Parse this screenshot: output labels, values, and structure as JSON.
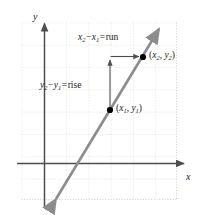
{
  "figure": {
    "background_color": "#ffffff",
    "width": 201,
    "height": 215
  },
  "axes": {
    "x_label": "x",
    "y_label": "y",
    "axis_color": "#4d4d4d",
    "grid_color": "#c8c8c8",
    "grid_spacing": 22,
    "origin": {
      "x": 44,
      "y": 163
    }
  },
  "line": {
    "color": "#8c8c8c",
    "from": {
      "x": 53,
      "y": 203
    },
    "to": {
      "x": 162,
      "y": 25
    },
    "double_arrow": true
  },
  "points": [
    {
      "name": "point-1",
      "label_x": "x",
      "label_x_sub": "1",
      "label_y": "y",
      "label_y_sub": "1",
      "x": 110,
      "y": 110,
      "color": "#000000"
    },
    {
      "name": "point-2",
      "label_x": "x",
      "label_x_sub": "2",
      "label_y": "y",
      "label_y_sub": "2",
      "x": 143,
      "y": 57,
      "color": "#000000"
    }
  ],
  "annotations": {
    "run": {
      "term_a": "x",
      "term_a_sub": "2",
      "operator": "−",
      "term_b": "x",
      "term_b_sub": "1",
      "equals": "=",
      "result": "run",
      "arrow_color": "#4d4d4d"
    },
    "rise": {
      "term_a": "y",
      "term_a_sub": "2",
      "operator": "−",
      "term_b": "y",
      "term_b_sub": "1",
      "equals": "=",
      "result": "rise",
      "arrow_color": "#4d4d4d"
    }
  },
  "paren": {
    "open": "(",
    "close": ")",
    "comma": ","
  }
}
